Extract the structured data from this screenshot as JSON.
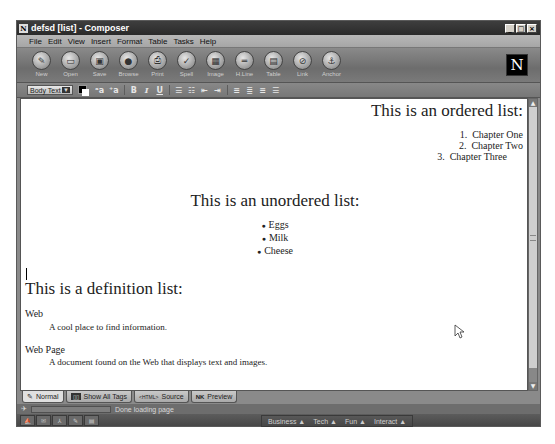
{
  "window": {
    "title": "defsd [list] - Composer",
    "app_icon": "N",
    "controls": {
      "minimize": "_",
      "maximize": "□",
      "close": "×"
    }
  },
  "menubar": {
    "items": [
      {
        "label": "File",
        "accel": "F"
      },
      {
        "label": "Edit",
        "accel": "E"
      },
      {
        "label": "View",
        "accel": "V"
      },
      {
        "label": "Insert",
        "accel": "I"
      },
      {
        "label": "Format",
        "accel": "o"
      },
      {
        "label": "Table",
        "accel": "b"
      },
      {
        "label": "Tasks",
        "accel": "T"
      },
      {
        "label": "Help",
        "accel": "H"
      }
    ]
  },
  "toolbar": {
    "buttons": [
      {
        "label": "New",
        "icon": "✎"
      },
      {
        "label": "Open",
        "icon": "▭"
      },
      {
        "label": "Save",
        "icon": "▣"
      },
      {
        "label": "Browse",
        "icon": "●"
      },
      {
        "label": "Print",
        "icon": "⎙"
      },
      {
        "label": "Spell",
        "icon": "✓"
      },
      {
        "label": "Image",
        "icon": "▦"
      },
      {
        "label": "H.Line",
        "icon": "═"
      },
      {
        "label": "Table",
        "icon": "▤"
      },
      {
        "label": "Link",
        "icon": "⊘"
      },
      {
        "label": "Anchor",
        "icon": "⚓"
      }
    ],
    "logo": "N"
  },
  "formatbar": {
    "paragraph_style": "Body Text",
    "dropdown_arrow": "▼",
    "text_color": "#000000",
    "background_color": "#ffffff",
    "buttons": {
      "smaller": "ᵃa",
      "larger": "⁺a",
      "bold": "B",
      "italic": "I",
      "underline": "U",
      "bullet_list": "☰",
      "numbered_list": "☷",
      "outdent": "⇤",
      "indent": "⇥",
      "align_left": "≡",
      "align_center": "≣",
      "align_right": "≡",
      "justify": "☰"
    }
  },
  "document": {
    "ordered_heading": "This is an ordered list:",
    "ordered_items": [
      {
        "num": "1.",
        "text": "Chapter One"
      },
      {
        "num": "2.",
        "text": "Chapter Two"
      },
      {
        "num": "3.",
        "text": "Chapter Three"
      }
    ],
    "unordered_heading": "This is an unordered list:",
    "unordered_items": [
      "Eggs",
      "Milk",
      "Cheese"
    ],
    "definition_heading": "This is a definition list:",
    "definitions": [
      {
        "term": "Web",
        "definition": "A cool place to find information."
      },
      {
        "term": "Web Page",
        "definition": "A document found on the Web that displays text and images."
      }
    ]
  },
  "scrollbar": {
    "up": "▲",
    "down": "▼"
  },
  "tabs": [
    {
      "label": "Normal",
      "icon": "✎",
      "active": true
    },
    {
      "label": "Show All Tags",
      "icon": "▯▯",
      "active": false
    },
    {
      "label": "Source",
      "icon": "<HTML>",
      "active": false
    },
    {
      "label": "Preview",
      "icon": "NK",
      "active": false
    }
  ],
  "status": {
    "text": "Done loading page",
    "progress_percent": 0
  },
  "component_bar": {
    "buttons": [
      "navigator",
      "mail",
      "instant-messenger",
      "composer",
      "address-book"
    ],
    "glyphs": [
      "⛵",
      "✉",
      "⅄",
      "✎",
      "▤"
    ]
  },
  "portal_menu": [
    {
      "label": "Business",
      "arrow": "▲"
    },
    {
      "label": "Tech",
      "arrow": "▲"
    },
    {
      "label": "Fun",
      "arrow": "▲"
    },
    {
      "label": "Interact",
      "arrow": "▲"
    }
  ]
}
